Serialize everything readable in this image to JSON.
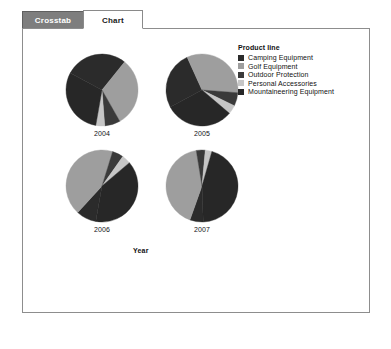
{
  "tabs": [
    {
      "label": "Crosstab",
      "active": false,
      "name": "tab-crosstab"
    },
    {
      "label": "Chart",
      "active": true,
      "name": "tab-chart"
    }
  ],
  "legend": {
    "title": "Product line",
    "items": [
      {
        "label": "Camping Equipment",
        "color": "#2b2b2b"
      },
      {
        "label": "Golf Equipment",
        "color": "#9e9e9e"
      },
      {
        "label": "Outdoor Protection",
        "color": "#3a3a3a"
      },
      {
        "label": "Personal Accessories",
        "color": "#c6c6c6"
      },
      {
        "label": "Mountaineering Equipment",
        "color": "#272727"
      }
    ]
  },
  "axis": {
    "category_title": "Year"
  },
  "chart_data": {
    "type": "pie",
    "title": "",
    "subtitle": "",
    "xlabel": "Year",
    "ylabel": "",
    "legend_title": "Product line",
    "legend_position": "right",
    "grid": false,
    "categories": [
      "Camping Equipment",
      "Golf Equipment",
      "Outdoor Protection",
      "Personal Accessories",
      "Mountaineering Equipment"
    ],
    "colors": [
      "#2b2b2b",
      "#9e9e9e",
      "#3a3a3a",
      "#c6c6c6",
      "#272727"
    ],
    "panels": [
      {
        "label": "2004",
        "values": [
          28,
          31,
          7,
          4,
          30
        ]
      },
      {
        "label": "2005",
        "values": [
          26,
          33,
          6,
          4,
          31
        ]
      },
      {
        "label": "2006",
        "values": [
          9,
          43,
          5,
          4,
          39
        ]
      },
      {
        "label": "2007",
        "values": [
          6,
          42,
          4,
          3,
          45
        ]
      }
    ]
  }
}
